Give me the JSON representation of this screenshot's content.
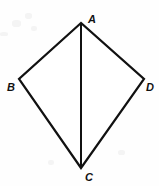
{
  "figure": {
    "type": "geometry-diagram",
    "shape_name": "kite",
    "background_color": "#fefefe",
    "stroke_color": "#111111",
    "canvas": {
      "width": 159,
      "height": 186
    },
    "vertices": [
      {
        "id": "A",
        "label": "A",
        "x": 81,
        "y": 23,
        "label_x": 88,
        "label_y": 14
      },
      {
        "id": "B",
        "label": "B",
        "x": 19,
        "y": 79,
        "label_x": 7,
        "label_y": 82
      },
      {
        "id": "C",
        "label": "C",
        "x": 81,
        "y": 168,
        "label_x": 85,
        "label_y": 172
      },
      {
        "id": "D",
        "label": "D",
        "x": 144,
        "y": 79,
        "label_x": 146,
        "label_y": 82
      }
    ],
    "edges": [
      {
        "id": "AB",
        "from": "A",
        "to": "B",
        "width": 2.2
      },
      {
        "id": "BC",
        "from": "B",
        "to": "C",
        "width": 2.2
      },
      {
        "id": "CD",
        "from": "C",
        "to": "D",
        "width": 2.2
      },
      {
        "id": "DA",
        "from": "D",
        "to": "A",
        "width": 2.2
      }
    ],
    "diagonals": [
      {
        "id": "AC",
        "from": "A",
        "to": "C",
        "width": 2.0
      }
    ],
    "outline_points": "81,23 19,79 81,168 144,79"
  }
}
